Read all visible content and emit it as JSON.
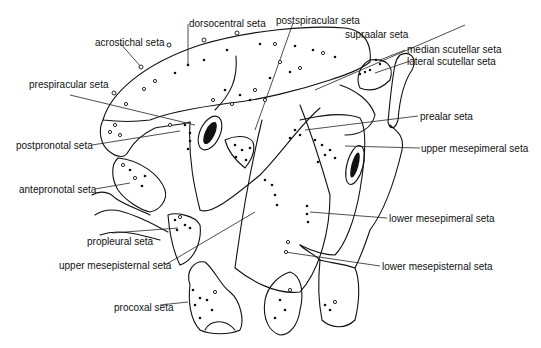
{
  "figure": {
    "background_color": "#ffffff",
    "ink_color": "#111111"
  },
  "labels": {
    "dorsocentral": "dorsocentral seta",
    "acrostichal": "acrostichal seta",
    "prespiracular": "prespiracular seta",
    "postpronotal": "postpronotal seta",
    "antepronotal": "antepronotal seta",
    "propleural": "propleural seta",
    "upper_mesepisternal": "upper mesepisternal seta",
    "procoxal": "procoxal seta",
    "postspiracular": "postspiracular seta",
    "supraalar": "supraalar seta",
    "median_scutellar": "median scutellar seta",
    "lateral_scutellar": "lateral scutellar seta",
    "prealar": "prealar seta",
    "upper_mesepimeral": "upper mesepimeral seta",
    "lower_mesepimeral": "lower mesepimeral seta",
    "lower_mesepisternal": "lower mesepisternal seta"
  }
}
